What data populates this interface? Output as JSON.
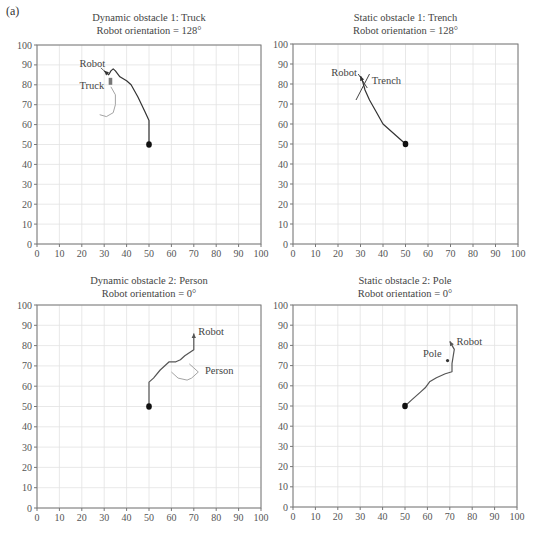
{
  "panel_label": "(a)",
  "chart_data": [
    {
      "type": "line",
      "title": "Dynamic obstacle 1: Truck",
      "subtitle": "Robot orientation = 128°",
      "xlabel": "",
      "ylabel": "",
      "xlim": [
        0,
        100
      ],
      "ylim": [
        0,
        100
      ],
      "xticks": [
        0,
        10,
        20,
        30,
        40,
        50,
        60,
        70,
        80,
        90,
        100
      ],
      "yticks": [
        0,
        10,
        20,
        30,
        40,
        50,
        60,
        70,
        80,
        90,
        100
      ],
      "grid": true,
      "start_point": [
        50,
        50
      ],
      "series": [
        {
          "name": "Robot",
          "color": "#333333",
          "points": [
            [
              50,
              50
            ],
            [
              50,
              62
            ],
            [
              48,
              67
            ],
            [
              45,
              74
            ],
            [
              42,
              80
            ],
            [
              40,
              82
            ],
            [
              37,
              84
            ],
            [
              35,
              87
            ],
            [
              34,
              88
            ],
            [
              33,
              87
            ],
            [
              32,
              85
            ],
            [
              31,
              86
            ],
            [
              30,
              87
            ]
          ]
        },
        {
          "name": "Truck",
          "color": "#999999",
          "points": [
            [
              33,
              79
            ],
            [
              35,
              75
            ],
            [
              35,
              70
            ],
            [
              34,
              66
            ],
            [
              31,
              64
            ],
            [
              28,
              65
            ]
          ]
        }
      ],
      "obstacle": {
        "kind": "rect",
        "label": "Truck",
        "x": 32,
        "y": 80,
        "w": 1.6,
        "h": 3.5
      },
      "annotations": [
        {
          "text": "Robot",
          "x": 19,
          "y": 89
        },
        {
          "text": "Truck",
          "x": 19,
          "y": 78
        }
      ]
    },
    {
      "type": "line",
      "title": "Static obstacle 1: Trench",
      "subtitle": "Robot orientation = 128°",
      "xlabel": "",
      "ylabel": "",
      "xlim": [
        0,
        100
      ],
      "ylim": [
        0,
        100
      ],
      "xticks": [
        0,
        10,
        20,
        30,
        40,
        50,
        60,
        70,
        80,
        90,
        100
      ],
      "yticks": [
        0,
        10,
        20,
        30,
        40,
        50,
        60,
        70,
        80,
        90,
        100
      ],
      "grid": true,
      "start_point": [
        50,
        50
      ],
      "series": [
        {
          "name": "Robot",
          "color": "#333333",
          "points": [
            [
              50,
              50
            ],
            [
              46,
              54
            ],
            [
              40,
              60
            ],
            [
              37,
              66
            ],
            [
              34,
              72
            ],
            [
              32,
              77
            ],
            [
              31,
              81
            ],
            [
              30,
              84
            ]
          ]
        }
      ],
      "obstacle": {
        "kind": "cross",
        "label": "Trench",
        "lines": [
          [
            [
              28,
              72
            ],
            [
              34,
              85
            ]
          ],
          [
            [
              29,
              85
            ],
            [
              33,
              78
            ]
          ]
        ]
      },
      "annotations": [
        {
          "text": "Robot",
          "x": 17,
          "y": 84
        },
        {
          "text": "Trench",
          "x": 35,
          "y": 80
        }
      ]
    },
    {
      "type": "line",
      "title": "Dynamic obstacle 2: Person",
      "subtitle": "Robot orientation = 0°",
      "xlabel": "",
      "ylabel": "",
      "xlim": [
        0,
        100
      ],
      "ylim": [
        0,
        100
      ],
      "xticks": [
        0,
        10,
        20,
        30,
        40,
        50,
        60,
        70,
        80,
        90,
        100
      ],
      "yticks": [
        0,
        10,
        20,
        30,
        40,
        50,
        60,
        70,
        80,
        90,
        100
      ],
      "grid": true,
      "start_point": [
        50,
        50
      ],
      "series": [
        {
          "name": "Robot",
          "color": "#555555",
          "points": [
            [
              50,
              50
            ],
            [
              50,
              62
            ],
            [
              52,
              64
            ],
            [
              55,
              68
            ],
            [
              59,
              72
            ],
            [
              62,
              72
            ],
            [
              64,
              73
            ],
            [
              66,
              75
            ],
            [
              70,
              78
            ],
            [
              70,
              79
            ],
            [
              70,
              86
            ]
          ]
        },
        {
          "name": "Person",
          "color": "#999999",
          "points": [
            [
              68,
              71
            ],
            [
              70,
              69
            ],
            [
              72,
              67
            ],
            [
              69,
              64
            ],
            [
              67,
              63
            ],
            [
              63,
              64
            ],
            [
              60,
              67
            ]
          ]
        }
      ],
      "annotations": [
        {
          "text": "Robot",
          "x": 72,
          "y": 85
        },
        {
          "text": "Person",
          "x": 75,
          "y": 66
        }
      ]
    },
    {
      "type": "line",
      "title": "Static obstacle 2: Pole",
      "subtitle": "Robot orientation = 0°",
      "xlabel": "",
      "ylabel": "",
      "xlim": [
        0,
        100
      ],
      "ylim": [
        0,
        100
      ],
      "xticks": [
        0,
        10,
        20,
        30,
        40,
        50,
        60,
        70,
        80,
        90,
        100
      ],
      "yticks": [
        0,
        10,
        20,
        30,
        40,
        50,
        60,
        70,
        80,
        90,
        100
      ],
      "grid": true,
      "start_point": [
        50,
        50
      ],
      "series": [
        {
          "name": "Robot",
          "color": "#555555",
          "points": [
            [
              50,
              50
            ],
            [
              53,
              53
            ],
            [
              57,
              57
            ],
            [
              59,
              59
            ],
            [
              61,
              62
            ],
            [
              64,
              64
            ],
            [
              68,
              66
            ],
            [
              71,
              67
            ],
            [
              71,
              71
            ],
            [
              72,
              78
            ],
            [
              71,
              80
            ],
            [
              70,
              82
            ]
          ]
        }
      ],
      "obstacle": {
        "kind": "point",
        "label": "Pole",
        "x": 69,
        "y": 72.5
      },
      "annotations": [
        {
          "text": "Robot",
          "x": 73,
          "y": 80
        },
        {
          "text": "Pole",
          "x": 58,
          "y": 74.5
        }
      ]
    }
  ]
}
